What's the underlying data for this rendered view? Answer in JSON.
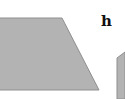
{
  "diagram": {
    "shapes": [
      {
        "type": "trapezoid",
        "fill": "#b3b3b3",
        "stroke": "#8f8f8f"
      },
      {
        "type": "partial-quadrilateral",
        "fill": "#b3b3b3",
        "stroke": "#8f8f8f"
      }
    ],
    "labels": {
      "h": "h"
    }
  }
}
